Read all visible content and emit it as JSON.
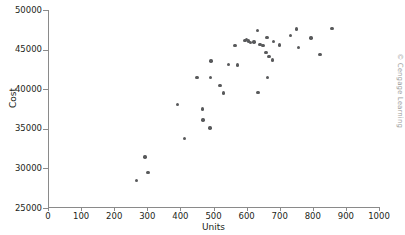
{
  "chart_data": {
    "type": "scatter",
    "title": "",
    "xlabel": "Units",
    "ylabel": "Cost",
    "xlim": [
      0,
      1000
    ],
    "ylim": [
      25000,
      50000
    ],
    "xticks": [
      0,
      100,
      200,
      300,
      400,
      500,
      600,
      700,
      800,
      900,
      1000
    ],
    "yticks": [
      25000,
      30000,
      35000,
      40000,
      45000,
      50000
    ],
    "xtick_labels": [
      "0",
      "100",
      "200",
      "300",
      "400",
      "500",
      "600",
      "700",
      "800",
      "900",
      "1000"
    ],
    "ytick_labels": [
      "25000",
      "30000",
      "35000",
      "40000",
      "45000",
      "50000"
    ],
    "grid": false,
    "legend": null,
    "marker_color": "#58595b",
    "axis_color": "#8a8a8a",
    "points": [
      {
        "x": 268,
        "y": 28450
      },
      {
        "x": 293,
        "y": 31450
      },
      {
        "x": 302,
        "y": 29500
      },
      {
        "x": 392,
        "y": 38050
      },
      {
        "x": 412,
        "y": 33750
      },
      {
        "x": 450,
        "y": 41450
      },
      {
        "x": 466,
        "y": 37500
      },
      {
        "x": 468,
        "y": 36100
      },
      {
        "x": 489,
        "y": 35100
      },
      {
        "x": 491,
        "y": 41450
      },
      {
        "x": 492,
        "y": 43550
      },
      {
        "x": 520,
        "y": 40500
      },
      {
        "x": 530,
        "y": 39500
      },
      {
        "x": 545,
        "y": 43100
      },
      {
        "x": 565,
        "y": 45500
      },
      {
        "x": 572,
        "y": 43050
      },
      {
        "x": 595,
        "y": 46150
      },
      {
        "x": 600,
        "y": 46300
      },
      {
        "x": 606,
        "y": 46100
      },
      {
        "x": 612,
        "y": 45900
      },
      {
        "x": 622,
        "y": 45950
      },
      {
        "x": 633,
        "y": 47450
      },
      {
        "x": 634,
        "y": 39550
      },
      {
        "x": 641,
        "y": 45650
      },
      {
        "x": 650,
        "y": 45550
      },
      {
        "x": 658,
        "y": 44650
      },
      {
        "x": 662,
        "y": 46500
      },
      {
        "x": 663,
        "y": 41500
      },
      {
        "x": 668,
        "y": 44100
      },
      {
        "x": 678,
        "y": 43700
      },
      {
        "x": 681,
        "y": 46000
      },
      {
        "x": 700,
        "y": 45600
      },
      {
        "x": 733,
        "y": 46750
      },
      {
        "x": 751,
        "y": 47600
      },
      {
        "x": 757,
        "y": 45250
      },
      {
        "x": 795,
        "y": 46450
      },
      {
        "x": 822,
        "y": 44350
      },
      {
        "x": 858,
        "y": 47650
      }
    ]
  },
  "credit": {
    "text": "© Cengage Learning"
  }
}
